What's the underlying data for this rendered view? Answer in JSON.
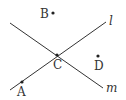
{
  "diagram": {
    "lines": [
      {
        "name": "l",
        "label": "l",
        "x1": 10,
        "y1": 90,
        "x2": 106,
        "y2": 22,
        "lx": 109,
        "ly": 25
      },
      {
        "name": "m",
        "label": "m",
        "x1": 10,
        "y1": 23,
        "x2": 103,
        "y2": 88,
        "lx": 106,
        "ly": 92
      }
    ],
    "points": [
      {
        "name": "A",
        "label": "A",
        "x": 22,
        "y": 82,
        "lx": 17,
        "ly": 96
      },
      {
        "name": "B",
        "label": "B",
        "x": 53,
        "y": 13,
        "lx": 40,
        "ly": 18
      },
      {
        "name": "C",
        "label": "C",
        "x": 57,
        "y": 55,
        "lx": 53,
        "ly": 69
      },
      {
        "name": "D",
        "label": "D",
        "x": 98,
        "y": 56,
        "lx": 94,
        "ly": 70
      }
    ],
    "color": "#333333"
  }
}
